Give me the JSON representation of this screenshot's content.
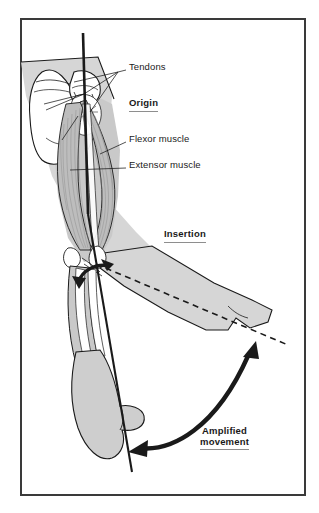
{
  "figure": {
    "type": "anatomical-diagram",
    "border_color": "#3a3a3a",
    "background_color": "#ffffff",
    "muscle_fill": "#b9b9b9",
    "bone_fill": "#ffffff",
    "body_fill": "#d2d2d2",
    "line_color": "#1a1a1a",
    "underline_color": "#8e8e8e"
  },
  "labels": [
    {
      "id": "tendons",
      "text": "Tendons",
      "style": "plain",
      "underlined": false,
      "x": 129,
      "y": 68
    },
    {
      "id": "origin",
      "text": "Origin",
      "style": "bold",
      "underlined": true,
      "x": 129,
      "y": 104
    },
    {
      "id": "flexor",
      "text": "Flexor muscle",
      "style": "plain",
      "underlined": false,
      "x": 129,
      "y": 140
    },
    {
      "id": "extensor",
      "text": "Extensor muscle",
      "style": "plain",
      "underlined": false,
      "x": 129,
      "y": 166
    },
    {
      "id": "insertion",
      "text": "Insertion",
      "style": "bold",
      "underlined": true,
      "x": 164,
      "y": 235
    }
  ],
  "amplified": {
    "line1": "Amplified",
    "line2": "movement",
    "style": "bold",
    "underlined": true,
    "x": 200,
    "y": 430
  },
  "annotations": {
    "lever_axis_label": "lever line",
    "resting_axis_label": "resting limb axis (dashed)",
    "joint_arrow_label": "small joint rotation arrow",
    "movement_arrow_label": "large amplified movement arrow"
  }
}
